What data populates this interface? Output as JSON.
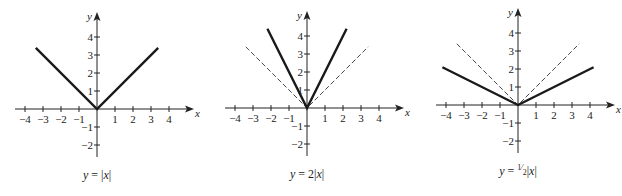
{
  "chart_data": [
    {
      "type": "line",
      "title": "y = |x|",
      "caption": {
        "prefix": "y = ",
        "coef": "",
        "coef_num": "",
        "coef_den": "",
        "suffix": "|x|"
      },
      "xlabel": "x",
      "ylabel": "y",
      "xlim": [
        -4,
        4
      ],
      "ylim": [
        -2,
        4
      ],
      "x_ticks": [
        -4,
        -3,
        -2,
        -1,
        1,
        2,
        3,
        4
      ],
      "y_ticks": [
        -2,
        -1,
        1,
        2,
        3,
        4
      ],
      "grid": false,
      "series": [
        {
          "name": "y = |x|",
          "style": "solid",
          "x": [
            -3.4,
            0,
            3.4
          ],
          "y": [
            3.4,
            0,
            3.4
          ]
        }
      ],
      "origin_px": [
        97,
        109
      ],
      "unit_px": 18
    },
    {
      "type": "line",
      "title": "y = 2|x|",
      "caption": {
        "prefix": "y = ",
        "coef": "2",
        "coef_num": "",
        "coef_den": "",
        "suffix": "|x|"
      },
      "xlabel": "x",
      "ylabel": "y",
      "xlim": [
        -4,
        4
      ],
      "ylim": [
        -2,
        4
      ],
      "x_ticks": [
        -4,
        -3,
        -2,
        -1,
        1,
        2,
        3,
        4
      ],
      "y_ticks": [
        -2,
        -1,
        1,
        2,
        3,
        4
      ],
      "grid": false,
      "series": [
        {
          "name": "y = |x|",
          "style": "dashed",
          "x": [
            -3.4,
            0,
            3.4
          ],
          "y": [
            3.4,
            0,
            3.4
          ]
        },
        {
          "name": "y = 2|x|",
          "style": "solid",
          "x": [
            -2.2,
            0,
            2.2
          ],
          "y": [
            4.4,
            0,
            4.4
          ]
        }
      ],
      "origin_px": [
        307,
        108
      ],
      "unit_px": 18
    },
    {
      "type": "line",
      "title": "y = ½|x|",
      "caption": {
        "prefix": "y = ",
        "coef": "",
        "coef_num": "1",
        "coef_den": "2",
        "suffix": "|x|"
      },
      "xlabel": "x",
      "ylabel": "y",
      "xlim": [
        -4,
        4
      ],
      "ylim": [
        -2,
        4
      ],
      "x_ticks": [
        -4,
        -3,
        -2,
        -1,
        1,
        2,
        3,
        4
      ],
      "y_ticks": [
        -2,
        -1,
        1,
        2,
        3,
        4
      ],
      "grid": false,
      "series": [
        {
          "name": "y = |x|",
          "style": "dashed",
          "x": [
            -3.4,
            0,
            3.4
          ],
          "y": [
            3.4,
            0,
            3.4
          ]
        },
        {
          "name": "y = ½|x|",
          "style": "solid",
          "x": [
            -4.2,
            0,
            4.2
          ],
          "y": [
            2.1,
            0,
            2.1
          ]
        }
      ],
      "origin_px": [
        518,
        105
      ],
      "unit_px": 18
    }
  ],
  "colors": {
    "axis": "#222222",
    "curve": "#1a1a1a",
    "dashed": "#333333",
    "background": "#ffffff"
  }
}
